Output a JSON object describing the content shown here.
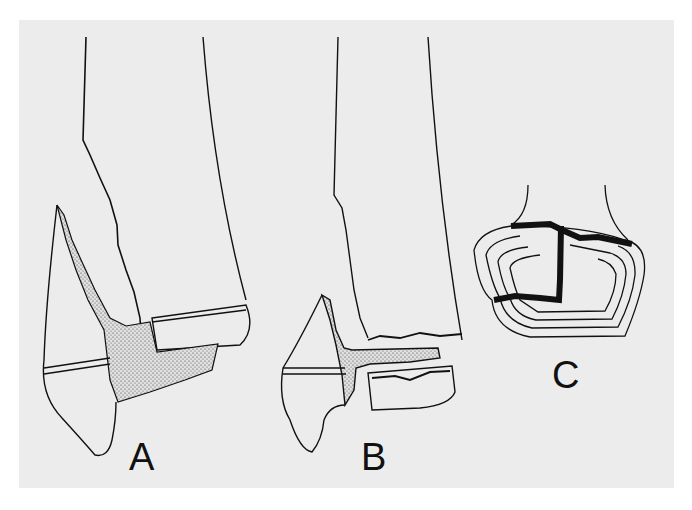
{
  "figure": {
    "panels": [
      {
        "id": "A",
        "label": "A",
        "description": "Distal bone with oblique metaphyseal fracture extending through physis; displaced epiphysis with stippled fracture zone"
      },
      {
        "id": "B",
        "label": "B",
        "description": "Distal bone with triplane-type fracture; separated epiphyseal fragment with stippled fracture lines"
      },
      {
        "id": "C",
        "label": "C",
        "description": "Axial view of epiphysis showing fracture line (bold) across growth plate rings"
      }
    ]
  },
  "colors": {
    "background": "#ececec",
    "border": "#ffffff",
    "ink": "#111111",
    "stipple": "#d4d4d4"
  }
}
